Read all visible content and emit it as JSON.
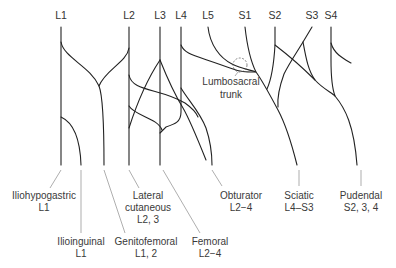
{
  "diagram": {
    "roots": [
      {
        "label": "L1",
        "x": 61
      },
      {
        "label": "L2",
        "x": 129
      },
      {
        "label": "L3",
        "x": 160
      },
      {
        "label": "L4",
        "x": 181
      },
      {
        "label": "L5",
        "x": 208
      },
      {
        "label": "S1",
        "x": 245
      },
      {
        "label": "S2",
        "x": 275
      },
      {
        "label": "S3",
        "x": 312
      },
      {
        "label": "S4",
        "x": 331
      }
    ],
    "annotation": {
      "line1": "Lumbosacral",
      "line2": "trunk"
    },
    "nerves": [
      {
        "name": "Iliohypogastric",
        "roots": "L1"
      },
      {
        "name": "Ilioinguinal",
        "roots": "L1"
      },
      {
        "name": "Lateral",
        "name2": "cutaneous",
        "roots": "L2, 3"
      },
      {
        "name": "Genitofemoral",
        "roots": "L1, 2"
      },
      {
        "name": "Femoral",
        "roots": "L2−4"
      },
      {
        "name": "Obturator",
        "roots": "L2−4"
      },
      {
        "name": "Sciatic",
        "roots": "L4–S3"
      },
      {
        "name": "Pudendal",
        "roots": "S2, 3, 4"
      }
    ],
    "colors": {
      "nerve": "#222222",
      "text": "#333333",
      "leader": "#777777"
    }
  }
}
